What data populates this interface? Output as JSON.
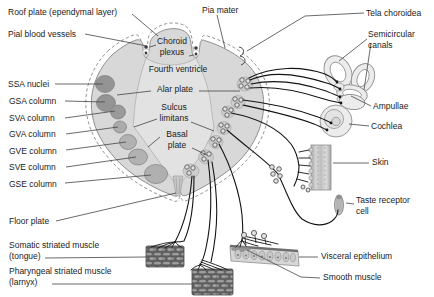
{
  "figure_kind": "anatomical-diagram-brainstem-cross-section",
  "labels": {
    "roof_plate": "Roof plate (ependymal layer)",
    "pial_blood_vessels": "Pial blood vessels",
    "pia_mater": "Pia mater",
    "tela_choroidea": "Tela choroidea",
    "semicircular_canals": "Semicircular\ncanals",
    "choroid_plexus": "Choroid\nplexus",
    "fourth_ventricle": "Fourth ventricle",
    "alar_plate": "Alar plate",
    "sulcus_limitans": "Sulcus\nlimitans",
    "basal_plate": "Basal\nplate",
    "ssa_nuclei": "SSA nuclei",
    "gsa_column": "GSA column",
    "sva_column": "SVA column",
    "gva_column": "GVA column",
    "gve_column": "GVE column",
    "sve_column": "SVE column",
    "gse_column": "GSE column",
    "floor_plate": "Floor plate",
    "somatic_striated_muscle": "Somatic striated muscle\n(tongue)",
    "pharyngeal_striated_muscle": "Pharyngeal striated muscle\n(larnyx)",
    "ampullae": "Ampullae",
    "cochlea": "Cochlea",
    "skin": "Skin",
    "taste_receptor_cell": "Taste receptor\ncell",
    "visceral_epithelium": "Visceral epithelium",
    "smooth_muscle": "Smooth muscle"
  },
  "colors": {
    "background": "#ffffff",
    "section_gray": "#d8d8d8",
    "lumen_gray": "#e2e2e2",
    "nucleus_gray": "#9a9a9a",
    "outline_gray": "#8f8f8f",
    "ink": "#1b1b1b"
  }
}
